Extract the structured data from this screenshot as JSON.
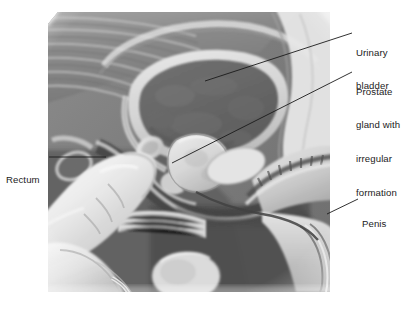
{
  "figure": {
    "style": "grayscale medical illustration",
    "background_color": "#ffffff",
    "line_color": "#1b1b1b",
    "text_color": "#1b1b1b"
  },
  "labels": {
    "urinary_bladder": {
      "name": "Urinary bladder",
      "lines": [
        "Urinary",
        "bladder"
      ]
    },
    "prostate": {
      "name": "Prostate gland with irregular formation",
      "lines": [
        "Prostate",
        "gland with",
        "irregular",
        "formation"
      ]
    },
    "rectum": {
      "name": "Rectum",
      "lines": [
        "Rectum"
      ]
    },
    "penis": {
      "name": "Penis",
      "lines": [
        "Penis"
      ]
    }
  },
  "leader_lines": [
    {
      "id": "urinary-bladder-leader",
      "from_x": 352,
      "from_y": 33,
      "to_x": 205,
      "to_y": 81
    },
    {
      "id": "prostate-leader",
      "from_x": 352,
      "from_y": 72,
      "to_x": 172,
      "to_y": 163
    },
    {
      "id": "rectum-leader",
      "from_x": 49,
      "from_y": 157,
      "to_x": 106,
      "to_y": 157
    },
    {
      "id": "penis-leader",
      "from_x": 358,
      "from_y": 199,
      "to_x": 327,
      "to_y": 214
    }
  ],
  "anatomy_parts": [
    "urinary bladder",
    "prostate gland with irregular formation",
    "rectum",
    "penis",
    "sacrum / coccyx",
    "pubic bone",
    "gloved examining finger",
    "urethra",
    "seminal vesicle",
    "scrotum / testis"
  ]
}
